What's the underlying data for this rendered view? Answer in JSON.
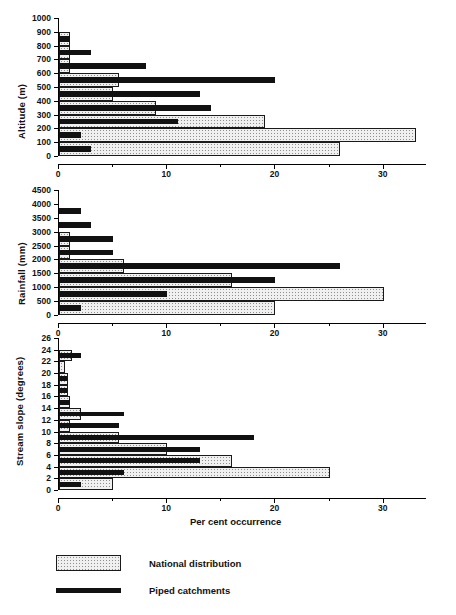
{
  "figure": {
    "xlabel": "Per cent occurrence",
    "legend": [
      {
        "key": "national",
        "label": "National distribution",
        "style": "stippled-box",
        "color": "#f0f0f0"
      },
      {
        "key": "piped",
        "label": "Piped catchments",
        "style": "solid-bar",
        "color": "#111111"
      }
    ]
  },
  "chart_data": [
    {
      "type": "bar",
      "orientation": "horizontal",
      "title": "",
      "ylabel": "Altitude (m)",
      "xlabel": "Per cent occurrence",
      "xlim": [
        0,
        34
      ],
      "ylim": [
        0,
        1000
      ],
      "xticks": [
        0,
        10,
        20,
        30
      ],
      "xticklabels": [
        "0",
        "10",
        "20",
        "30"
      ],
      "yticks": [
        0,
        100,
        200,
        300,
        400,
        500,
        600,
        700,
        800,
        900,
        1000
      ],
      "yticklabels": [
        "0",
        "100",
        "200",
        "300",
        "400",
        "500",
        "600",
        "700",
        "800",
        "900",
        "1000"
      ],
      "grid": false,
      "legend_position": "below-figure",
      "bands": [
        "0-100",
        "100-200",
        "200-300",
        "300-400",
        "400-500",
        "500-600",
        "600-700",
        "700-800",
        "800-900",
        "900-1000"
      ],
      "series": [
        {
          "name": "National distribution",
          "values": [
            26.0,
            33.0,
            19.0,
            9.0,
            5.0,
            5.5,
            1.0,
            1.0,
            1.0,
            0
          ]
        },
        {
          "name": "Piped catchments",
          "values": [
            3.0,
            2.0,
            11.0,
            14.0,
            13.0,
            20.0,
            8.0,
            3.0,
            1.0,
            0
          ]
        }
      ]
    },
    {
      "type": "bar",
      "orientation": "horizontal",
      "title": "",
      "ylabel": "Rainfall (mm)",
      "xlabel": "Per cent occurrence",
      "xlim": [
        0,
        34
      ],
      "ylim": [
        0,
        4500
      ],
      "xticks": [
        0,
        10,
        20,
        30
      ],
      "xticklabels": [
        "0",
        "10",
        "20",
        "30"
      ],
      "yticks": [
        0,
        500,
        1000,
        1500,
        2000,
        2500,
        3000,
        3500,
        4000,
        4500
      ],
      "yticklabels": [
        "0",
        "500",
        "1000",
        "1500",
        "2000",
        "2500",
        "3000",
        "3500",
        "4000",
        "4500"
      ],
      "grid": false,
      "legend_position": "below-figure",
      "bands": [
        "0-500",
        "500-1000",
        "1000-1500",
        "1500-2000",
        "2000-2500",
        "2500-3000",
        "3000-3500",
        "3500-4000",
        "4000-4500"
      ],
      "series": [
        {
          "name": "National distribution",
          "values": [
            20.0,
            30.0,
            16.0,
            6.0,
            1.0,
            1.0,
            0,
            0,
            0
          ]
        },
        {
          "name": "Piped catchments",
          "values": [
            2.0,
            10.0,
            20.0,
            26.0,
            5.0,
            5.0,
            3.0,
            2.0,
            0
          ]
        }
      ]
    },
    {
      "type": "bar",
      "orientation": "horizontal",
      "title": "",
      "ylabel": "Stream slope (degrees)",
      "xlabel": "Per cent occurrence",
      "xlim": [
        0,
        34
      ],
      "ylim": [
        0,
        26
      ],
      "xticks": [
        0,
        10,
        20,
        30
      ],
      "xticklabels": [
        "0",
        "10",
        "20",
        "30"
      ],
      "yticks": [
        0,
        2,
        4,
        6,
        8,
        10,
        12,
        14,
        16,
        18,
        20,
        22,
        24,
        26
      ],
      "yticklabels": [
        "0",
        "2",
        "4",
        "6",
        "8",
        "10",
        "12",
        "14",
        "16",
        "18",
        "20",
        "22",
        "24",
        "26"
      ],
      "grid": false,
      "legend_position": "below-figure",
      "bands": [
        "0-2",
        "2-4",
        "4-6",
        "6-8",
        "8-10",
        "10-12",
        "12-14",
        "14-16",
        "16-18",
        "18-20",
        "20-22",
        "22-24",
        "24-26"
      ],
      "series": [
        {
          "name": "National distribution",
          "values": [
            5.0,
            25.0,
            16.0,
            10.0,
            5.5,
            1.0,
            2.0,
            1.0,
            0.8,
            0.8,
            0.6,
            1.2,
            0
          ]
        },
        {
          "name": "Piped catchments",
          "values": [
            2.0,
            6.0,
            13.0,
            13.0,
            18.0,
            5.5,
            6.0,
            1.0,
            0.7,
            0.7,
            0,
            2.0,
            0
          ]
        }
      ]
    }
  ]
}
